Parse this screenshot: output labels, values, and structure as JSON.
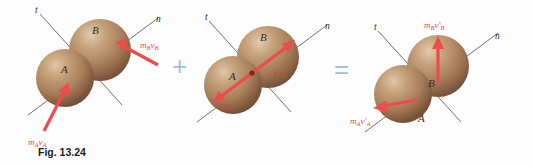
{
  "figure": {
    "caption": "Fig. 13.24",
    "topic": "Oblique central impact — impulse-momentum diagram",
    "operators": {
      "plus": "+",
      "equals": "="
    },
    "colors": {
      "sphere_base": "#a87d5c",
      "sphere_highlight": "#d8bda0",
      "sphere_shadow": "#6e4e34",
      "vector_red": "#ee4b4b",
      "impulse_red": "#d2453f",
      "operator_blue": "#9fc0dd",
      "axis_gray": "#4a4a55",
      "contact_dot": "#8b1f10"
    }
  },
  "panels": [
    {
      "id": "before-impact",
      "name": "initial-momenta",
      "axes": [
        {
          "name": "t-axis",
          "label": "t"
        },
        {
          "name": "n-axis",
          "label": "n"
        }
      ],
      "spheres": [
        {
          "name": "sphere-a",
          "label": "A"
        },
        {
          "name": "sphere-b",
          "label": "B"
        }
      ],
      "vectors": [
        {
          "name": "momentum-a-initial",
          "base": "m",
          "base_sub": "A",
          "sym": "v",
          "sym_sub": "A",
          "prime": "",
          "text": "mₐvₐ"
        },
        {
          "name": "momentum-b-initial",
          "base": "m",
          "base_sub": "B",
          "sym": "v",
          "sym_sub": "B",
          "prime": "",
          "text": "mʙvʙ"
        }
      ]
    },
    {
      "id": "impulses",
      "name": "impulse-pair",
      "axes": [
        {
          "name": "t-axis",
          "label": "t"
        },
        {
          "name": "n-axis",
          "label": "n"
        }
      ],
      "spheres": [
        {
          "name": "sphere-a",
          "label": "A"
        },
        {
          "name": "sphere-b",
          "label": "B"
        }
      ],
      "vectors": [
        {
          "name": "impulse-on-a",
          "text": "FΔt"
        },
        {
          "name": "impulse-on-b",
          "text": "−FΔt"
        }
      ]
    },
    {
      "id": "after-impact",
      "name": "final-momenta",
      "axes": [
        {
          "name": "t-axis",
          "label": "t"
        },
        {
          "name": "n-axis",
          "label": "n"
        }
      ],
      "spheres": [
        {
          "name": "sphere-a",
          "label": "A"
        },
        {
          "name": "sphere-b",
          "label": "B"
        }
      ],
      "vectors": [
        {
          "name": "momentum-a-final",
          "base": "m",
          "base_sub": "A",
          "sym": "v",
          "sym_sub": "A",
          "prime": "′",
          "text": "mₐv′ₐ"
        },
        {
          "name": "momentum-b-final",
          "base": "m",
          "base_sub": "B",
          "sym": "v",
          "sym_sub": "B",
          "prime": "′",
          "text": "mʙv′ʙ"
        }
      ]
    }
  ],
  "labels": {
    "t": "t",
    "n": "n",
    "A": "A",
    "B": "B",
    "m": "m",
    "v": "v",
    "sub_a": "A",
    "sub_b": "B",
    "prime": "′",
    "impulse_pos": "FΔt",
    "impulse_neg": "−FΔt",
    "plus": "+",
    "equals": "="
  }
}
